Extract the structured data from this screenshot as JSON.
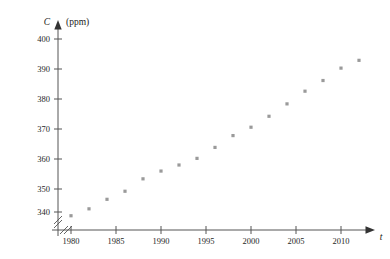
{
  "chart_data": {
    "type": "scatter",
    "title": "",
    "xlabel": "t",
    "ylabel": "C",
    "yunit": "(ppm)",
    "x": [
      1980,
      1982,
      1984,
      1986,
      1988,
      1990,
      1992,
      1994,
      1996,
      1998,
      2000,
      2002,
      2004,
      2006,
      2008,
      2010,
      2012
    ],
    "values": [
      338.7,
      341.1,
      344.4,
      347.2,
      351.5,
      354.2,
      356.3,
      358.6,
      362.4,
      366.5,
      369.4,
      373.2,
      377.5,
      381.9,
      385.6,
      389.9,
      392.6
    ],
    "xticks": [
      1980,
      1985,
      1990,
      1995,
      2000,
      2005,
      2010
    ],
    "xticklabels": [
      "1980",
      "1985",
      "1990",
      "1995",
      "2000",
      "2005",
      "2010"
    ],
    "yticks": [
      340,
      350,
      360,
      370,
      380,
      390,
      400
    ],
    "yticklabels": [
      "340",
      "350",
      "360",
      "370",
      "380",
      "390",
      "400"
    ],
    "xlim": [
      1978.4,
      2014.0
    ],
    "ylim": [
      335.0,
      403.0
    ],
    "grid": false,
    "legend": false,
    "axis_break_x": true,
    "axis_break_y": true,
    "marker": "square",
    "marker_color": "#9a9a9a",
    "axis_color": "#555555"
  }
}
